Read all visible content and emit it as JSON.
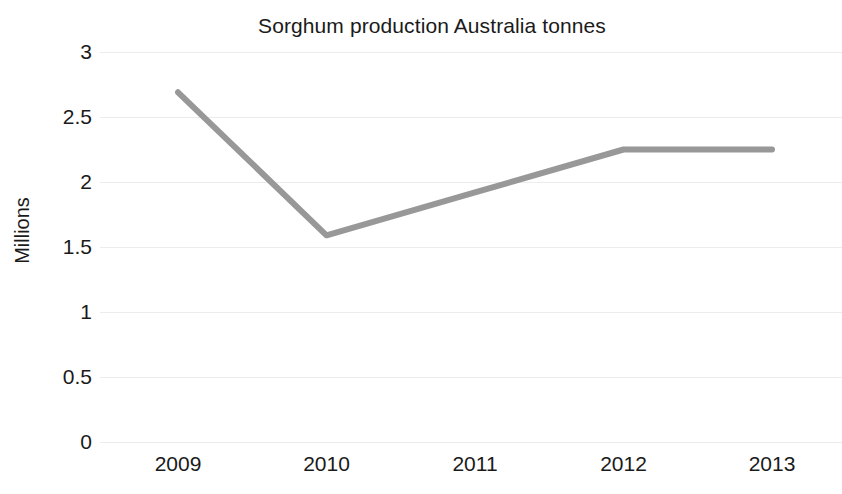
{
  "chart_data": {
    "type": "line",
    "title": "Sorghum production Australia tonnes",
    "xlabel": "",
    "ylabel": "Millions",
    "categories": [
      "2009",
      "2010",
      "2011",
      "2012",
      "2013"
    ],
    "values": [
      2.69,
      1.59,
      1.92,
      2.25,
      2.25
    ],
    "series": [
      {
        "name": "Sorghum production Australia tonnes",
        "values": [
          2.69,
          1.59,
          1.92,
          2.25,
          2.25
        ]
      }
    ],
    "ylim": [
      0,
      3
    ],
    "xlim": [
      "2009",
      "2013"
    ],
    "y_ticks": [
      "0",
      "0.5",
      "1",
      "1.5",
      "2",
      "2.5",
      "3"
    ],
    "y_tick_values": [
      0,
      0.5,
      1,
      1.5,
      2,
      2.5,
      3
    ],
    "x_ticks": [
      "2009",
      "2010",
      "2011",
      "2012",
      "2013"
    ],
    "grid": "horizontal",
    "legend": "none",
    "line_color": "#989898",
    "grid_color": "#ececec",
    "background_color": "#ffffff",
    "text_color": "#1a1a1a"
  }
}
